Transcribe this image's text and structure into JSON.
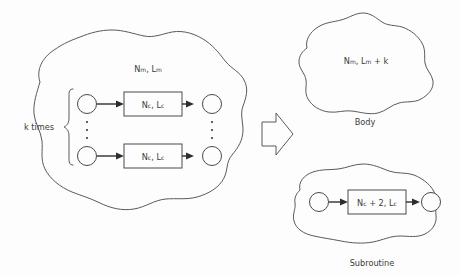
{
  "diagram": {
    "background_color": "#fdfdfd",
    "outline_color": "#5a5a5a",
    "text_color": "#3c3c3c",
    "arrow_color": "#2e2e2e"
  },
  "left_region": {
    "name": "loop-region",
    "module_label": {
      "base": "N",
      "sub": "m",
      "rest": ", L",
      "sub2": "m"
    },
    "module_label_text": "N_m , L_m",
    "repeat_label": "k times",
    "rows": [
      {
        "id": "row-top",
        "box_label_text": "N_c , L_c",
        "box_parts": {
          "n": "N",
          "n_sub": "c",
          "mid": ", L",
          "l_sub": "c"
        }
      },
      {
        "id": "row-bottom",
        "box_label_text": "N_c , L_c",
        "box_parts": {
          "n": "N",
          "n_sub": "c",
          "mid": ", L",
          "l_sub": "c"
        }
      }
    ],
    "ellipsis_dot_count": 3
  },
  "transform_arrow": {
    "name": "transformation-arrow",
    "direction": "right",
    "style": "hollow-block-arrow"
  },
  "body_region": {
    "name": "body-region",
    "caption": "Body",
    "label_text": "N_m , L_m + k",
    "label_parts": {
      "n": "N",
      "n_sub": "m",
      "mid": ", L",
      "l_sub": "m",
      "tail": " + k"
    }
  },
  "subroutine_region": {
    "name": "subroutine-region",
    "caption": "Subroutine",
    "box_label_text": "N_c + 2, L_c",
    "box_label_parts": {
      "n": "N",
      "n_sub": "c",
      "mid": " + 2, L",
      "l_sub": "c"
    }
  }
}
